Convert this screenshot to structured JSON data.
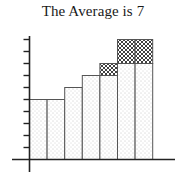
{
  "title": "The Average is 7",
  "chart_data": {
    "type": "bar",
    "title": "The Average is 7",
    "xlabel": "",
    "ylabel": "",
    "categories": [
      "1",
      "2",
      "3",
      "4",
      "5",
      "6",
      "7"
    ],
    "series": [
      {
        "name": "base (dotted)",
        "pattern": "dots",
        "values": [
          5,
          5,
          6,
          7,
          7,
          8,
          8
        ]
      },
      {
        "name": "excess (crosshatch)",
        "pattern": "crosshatch",
        "values": [
          0,
          0,
          0,
          0,
          1,
          2,
          2
        ]
      }
    ],
    "totals": [
      5,
      5,
      6,
      7,
      8,
      10,
      10
    ],
    "stacked": true,
    "ylim": [
      0,
      10.3
    ],
    "y_ticks": [
      1,
      2,
      3,
      4,
      5,
      6,
      7,
      8,
      9,
      10
    ],
    "y_tick_labels_shown": false,
    "x_tick_labels_shown": false,
    "grid": false,
    "legend": null,
    "colors": {
      "axis": "#222222",
      "bar_edge": "#555555",
      "dots": "#9a9a9a",
      "hatch": "#333333",
      "background": "#ffffff"
    }
  }
}
